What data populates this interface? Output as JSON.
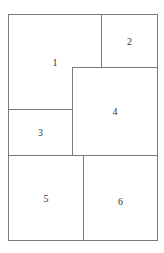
{
  "diagram": {
    "panels": [
      {
        "label": "1"
      },
      {
        "label": "2"
      },
      {
        "label": "3"
      },
      {
        "label": "4"
      },
      {
        "label": "5"
      },
      {
        "label": "6"
      }
    ]
  }
}
